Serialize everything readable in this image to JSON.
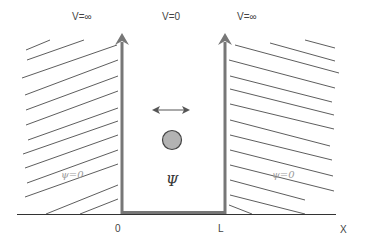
{
  "diagram": {
    "potential_labels": {
      "left": "V=∞",
      "center": "V=0",
      "right": "V=∞"
    },
    "axis": {
      "origin_label": "0",
      "width_label": "L",
      "axis_label": "X"
    },
    "wavefunction_labels": {
      "left_region": "ψ=0",
      "right_region": "ψ=0",
      "inside": "Ψ"
    },
    "elements": {
      "particle": "circle-particle",
      "motion_arrow": "double-headed-horizontal-arrow",
      "walls": "vertical-arrows-up"
    },
    "colors": {
      "wall": "#777777",
      "hatch": "#333333",
      "particle_fill": "#b3b3b3",
      "particle_stroke": "#444444",
      "axis": "#333333",
      "text": "#444444",
      "psi_zero_text": "#9a9a9a"
    }
  }
}
